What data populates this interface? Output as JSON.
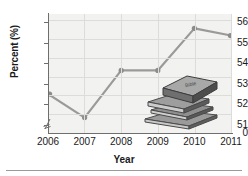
{
  "chart_data": {
    "type": "line",
    "title": "",
    "xlabel": "Year",
    "ylabel": "Percent (%)",
    "categories": [
      "2006",
      "2007",
      "2008",
      "2009",
      "2010",
      "2011"
    ],
    "x": [
      2006,
      2007,
      2008,
      2009,
      2010,
      2011
    ],
    "values": [
      52.5,
      51.35,
      53.65,
      53.65,
      55.7,
      55.35
    ],
    "series": [
      {
        "name": "Percent",
        "values": [
          52.5,
          51.35,
          53.65,
          53.65,
          55.7,
          55.35
        ]
      }
    ],
    "ylim": [
      50.6,
      56.4
    ],
    "y_ticks": [
      51,
      52,
      53,
      54,
      55,
      56
    ],
    "y_tick_labels": [
      "51",
      "52",
      "53",
      "54",
      "55",
      "56"
    ],
    "y_origin_label": "0",
    "y_axis_break": true,
    "x_ticks": [
      "2006",
      "2007",
      "2008",
      "2009",
      "2010",
      "2011"
    ],
    "grid": true,
    "legend": "none",
    "line_color": "#9a9a9a",
    "marker_color": "#8c8c8c",
    "plot_background": "#f2f2f0",
    "axis_color": "#6e6e6e",
    "text_color": "#1a1a1a"
  },
  "decoration": {
    "books_icon_name": "stack-of-books-illustration",
    "books_top_title": "Bible",
    "books_color_dark": "#5f5f5f",
    "books_color_mid": "#8a8a8a",
    "books_color_light": "#c8c8c8"
  },
  "axis": {
    "y_label": "Percent (%)",
    "x_label": "Year"
  }
}
